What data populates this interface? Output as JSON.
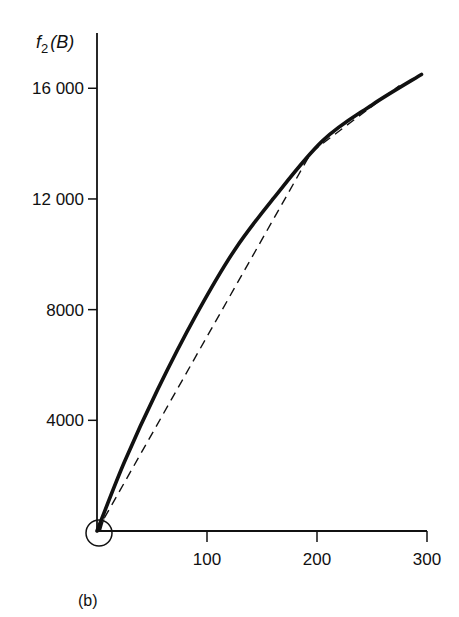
{
  "chart_data": {
    "type": "line",
    "title": "",
    "panel_label": "(b)",
    "ylabel": "f2(B)",
    "ylabel_main": "f",
    "ylabel_sub": "2",
    "ylabel_arg": "(B)",
    "xlabel": "",
    "xlim": [
      0,
      300
    ],
    "ylim": [
      0,
      18000
    ],
    "xticks": [
      100,
      200,
      300
    ],
    "xtick_labels": [
      "100",
      "200",
      "300"
    ],
    "yticks": [
      4000,
      8000,
      12000,
      16000
    ],
    "ytick_labels": [
      "4000",
      "8000",
      "12 000",
      "16 000"
    ],
    "grid": false,
    "legend": null,
    "origin_marker": "open-circle",
    "series": [
      {
        "name": "f2(B) curve",
        "style": "solid-thick",
        "color": "#111111",
        "x": [
          0,
          25,
          55,
          90,
          125,
          160,
          205,
          250,
          295
        ],
        "y": [
          0,
          2500,
          5100,
          7800,
          10150,
          12000,
          14100,
          15400,
          16500
        ]
      },
      {
        "name": "piecewise linear approximation",
        "style": "dashed",
        "color": "#111111",
        "x": [
          0,
          195,
          275
        ],
        "y": [
          0,
          13700,
          16100
        ]
      }
    ]
  }
}
